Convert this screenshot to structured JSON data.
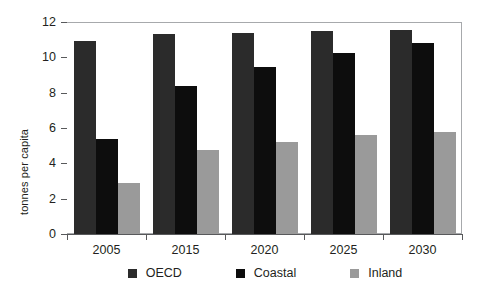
{
  "chart_data": {
    "type": "bar",
    "title": "",
    "xlabel": "",
    "ylabel": "tonnes per capita",
    "categories": [
      "2005",
      "2015",
      "2020",
      "2025",
      "2030"
    ],
    "series": [
      {
        "name": "OECD",
        "color": "#2b2b2b",
        "values": [
          10.9,
          11.3,
          11.4,
          11.5,
          11.55
        ]
      },
      {
        "name": "Coastal",
        "color": "#0d0d0d",
        "values": [
          5.35,
          8.4,
          9.45,
          10.25,
          10.8
        ]
      },
      {
        "name": "Inland",
        "color": "#9a9a9a",
        "values": [
          2.9,
          4.75,
          5.2,
          5.6,
          5.8
        ]
      }
    ],
    "ylim": [
      0,
      12
    ],
    "yticks": [
      "0",
      "2",
      "4",
      "6",
      "8",
      "10",
      "12"
    ],
    "ytick_values": [
      0,
      2,
      4,
      6,
      8,
      10,
      12
    ],
    "grid": false,
    "legend_position": "bottom"
  },
  "colors": {
    "axis": "#58595b",
    "frame": "#a7a9ac",
    "text": "#231f20",
    "background": "#ffffff"
  }
}
